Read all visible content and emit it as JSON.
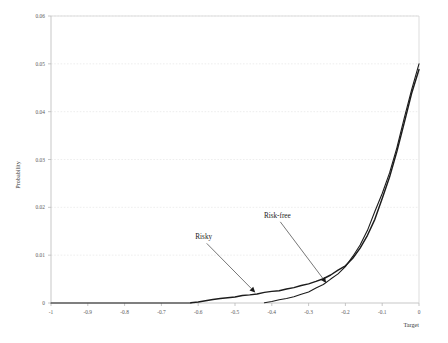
{
  "chart_data": {
    "type": "line",
    "title": "",
    "xlabel": "Target",
    "ylabel": "Probability",
    "xlim": [
      -1,
      0
    ],
    "ylim": [
      0,
      0.06
    ],
    "grid": true,
    "legend_position": "none",
    "x_ticks": [
      "-1",
      "-0.9",
      "-0.8",
      "-0.7",
      "-0.6",
      "-0.5",
      "-0.4",
      "-0.3",
      "-0.2",
      "-0.1",
      "0"
    ],
    "x_tick_values": [
      -1,
      -0.9,
      -0.8,
      -0.7,
      -0.6,
      -0.5,
      -0.4,
      -0.3,
      -0.2,
      -0.1,
      0
    ],
    "y_ticks": [
      "0",
      "0.01",
      "0.02",
      "0.03",
      "0.04",
      "0.05",
      "0.06"
    ],
    "y_tick_values": [
      0,
      0.01,
      0.02,
      0.03,
      0.04,
      0.05,
      0.06
    ],
    "annotations": [
      {
        "text": "Risky",
        "label_x": -0.585,
        "label_y": 0.0133,
        "point_x": -0.445,
        "point_y": 0.0022
      },
      {
        "text": "Risk-free",
        "label_x": -0.385,
        "label_y": 0.0178,
        "point_x": -0.252,
        "point_y": 0.0042
      }
    ],
    "series": [
      {
        "name": "Risky",
        "x": [
          -0.62,
          -0.6,
          -0.58,
          -0.56,
          -0.54,
          -0.52,
          -0.5,
          -0.48,
          -0.46,
          -0.44,
          -0.42,
          -0.4,
          -0.38,
          -0.36,
          -0.34,
          -0.32,
          -0.3,
          -0.28,
          -0.26,
          -0.24,
          -0.22,
          -0.2,
          -0.18,
          -0.16,
          -0.14,
          -0.12,
          -0.1,
          -0.08,
          -0.06,
          -0.04,
          -0.02,
          0.0
        ],
        "values": [
          5e-05,
          0.0002,
          0.0004,
          0.00062,
          0.00085,
          0.00105,
          0.00125,
          0.00145,
          0.00168,
          0.00195,
          0.00215,
          0.0024,
          0.00268,
          0.003,
          0.0033,
          0.00365,
          0.0041,
          0.0046,
          0.0052,
          0.0059,
          0.0068,
          0.0079,
          0.0094,
          0.0114,
          0.0142,
          0.0176,
          0.0218,
          0.0264,
          0.0318,
          0.0378,
          0.0438,
          0.0488
        ]
      },
      {
        "name": "Risk-free",
        "x": [
          -0.42,
          -0.4,
          -0.38,
          -0.36,
          -0.34,
          -0.32,
          -0.3,
          -0.28,
          -0.26,
          -0.24,
          -0.22,
          -0.2,
          -0.18,
          -0.16,
          -0.14,
          -0.12,
          -0.1,
          -0.08,
          -0.06,
          -0.04,
          -0.02,
          0.0
        ],
        "values": [
          4e-05,
          0.0003,
          0.00065,
          0.001,
          0.0014,
          0.00185,
          0.00235,
          0.003,
          0.004,
          0.005,
          0.0061,
          0.0076,
          0.0096,
          0.0122,
          0.0153,
          0.019,
          0.023,
          0.0272,
          0.0326,
          0.0386,
          0.0445,
          0.05
        ]
      }
    ]
  },
  "axes": {
    "y_title": "Probability",
    "x_title": "Target"
  }
}
